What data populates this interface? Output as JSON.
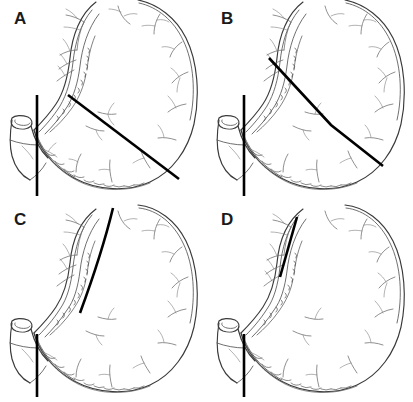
{
  "figure": {
    "background_color": "#ffffff",
    "line_color": "#3a3a3a",
    "resection_line_color": "#000000",
    "panel_count": 4,
    "layout": "2x2 grid"
  },
  "panels": [
    {
      "id": "a",
      "label": "A",
      "subject": "stomach-with-resection-line",
      "resection_lines": [
        {
          "name": "duodenal-transection-line",
          "shape": "vertical-straight"
        },
        {
          "name": "gastric-resection-line",
          "shape": "oblique-straight"
        }
      ]
    },
    {
      "id": "b",
      "label": "B",
      "subject": "stomach-with-resection-line",
      "resection_lines": [
        {
          "name": "duodenal-transection-line",
          "shape": "vertical-straight"
        },
        {
          "name": "gastric-resection-line",
          "shape": "angled-bent"
        }
      ]
    },
    {
      "id": "c",
      "label": "C",
      "subject": "stomach-with-resection-line",
      "resection_lines": [
        {
          "name": "duodenal-transection-line",
          "shape": "vertical-straight"
        },
        {
          "name": "gastric-resection-line",
          "shape": "long-curved-lesser-curvature"
        }
      ]
    },
    {
      "id": "d",
      "label": "D",
      "subject": "stomach-with-resection-line",
      "resection_lines": [
        {
          "name": "duodenal-transection-line",
          "shape": "vertical-straight"
        },
        {
          "name": "gastric-resection-line",
          "shape": "short-straight-lesser-curvature"
        }
      ]
    }
  ]
}
